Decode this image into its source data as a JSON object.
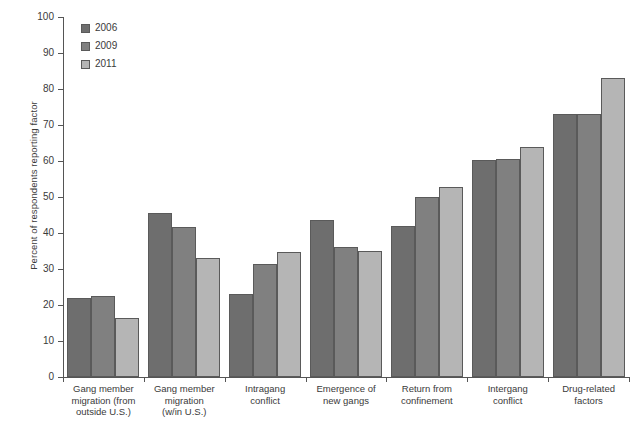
{
  "chart_data": {
    "type": "bar",
    "title": "",
    "xlabel": "",
    "ylabel": "Percent of respondents reporting factor",
    "ylim": [
      0,
      100
    ],
    "ytick_step": 10,
    "yticks": [
      "100",
      "90",
      "80",
      "70",
      "60",
      "50",
      "40",
      "30",
      "20",
      "10",
      "0"
    ],
    "grid": false,
    "legend_position": "top-left",
    "categories": [
      "Gang member migration (from outside U.S.)",
      "Gang member migration (w/in U.S.)",
      "Intragang conflict",
      "Emergence of new gangs",
      "Return from confinement",
      "Intergang conflict",
      "Drug-related factors"
    ],
    "category_lines": [
      [
        "Gang member",
        "migration (from",
        "outside U.S.)"
      ],
      [
        "Gang member",
        "migration",
        "(w/in U.S.)"
      ],
      [
        "Intragang",
        "conflict"
      ],
      [
        "Emergence of",
        "new gangs"
      ],
      [
        "Return from",
        "confinement"
      ],
      [
        "Intergang",
        "conflict"
      ],
      [
        "Drug-related",
        "factors"
      ]
    ],
    "series": [
      {
        "name": "2006",
        "color": "#6e6e6e",
        "values": [
          22,
          45.5,
          23,
          43.5,
          42,
          60.3,
          73
        ]
      },
      {
        "name": "2009",
        "color": "#808080",
        "values": [
          22.5,
          41.8,
          31.5,
          36,
          50,
          60.5,
          73
        ]
      },
      {
        "name": "2011",
        "color": "#b5b5b5",
        "values": [
          16.3,
          33,
          34.8,
          35,
          52.8,
          64,
          83
        ]
      }
    ]
  },
  "legend": {
    "items": [
      {
        "label": "2006",
        "color": "#6e6e6e"
      },
      {
        "label": "2009",
        "color": "#808080"
      },
      {
        "label": "2011",
        "color": "#b5b5b5"
      }
    ]
  },
  "caption": "",
  "colors": {
    "series_2006": "#6e6e6e",
    "series_2009": "#808080",
    "series_2011": "#b5b5b5",
    "axis": "#555555",
    "text": "#3a3a3a",
    "background": "#ffffff"
  }
}
